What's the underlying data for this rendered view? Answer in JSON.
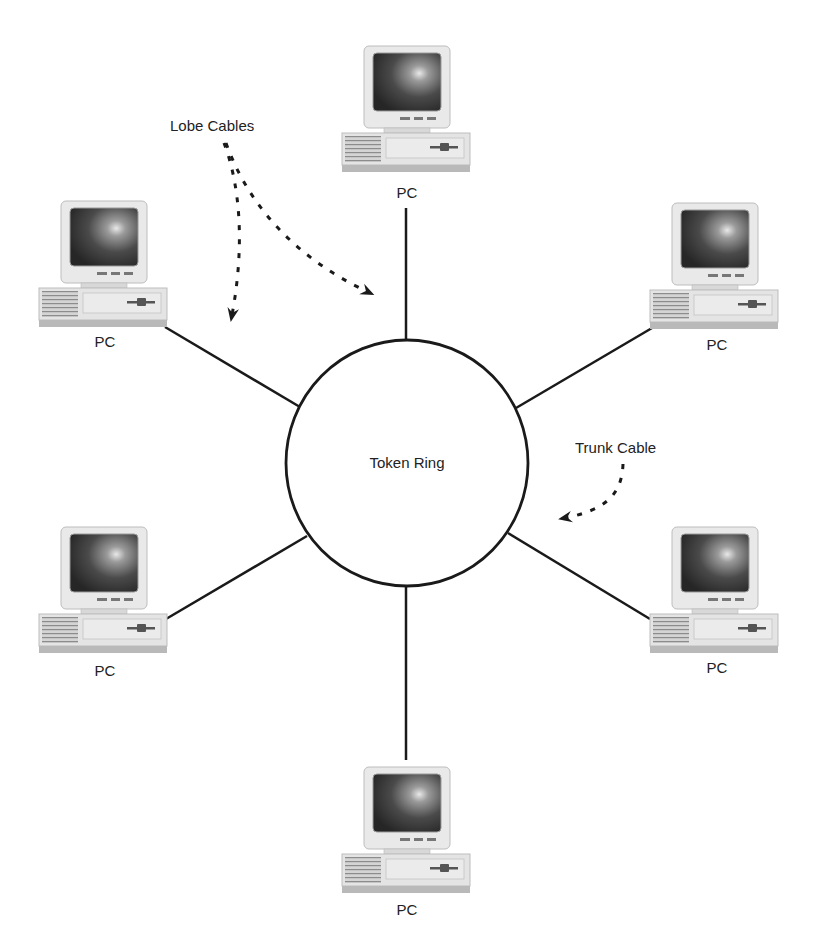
{
  "diagram": {
    "title": "Token Ring",
    "ring": {
      "label": "Token Ring",
      "cx": 407,
      "cy": 463,
      "r": 122
    },
    "annotations": {
      "lobe_cables": "Lobe Cables",
      "trunk_cable": "Trunk Cable"
    },
    "nodes": [
      {
        "id": "pc-top",
        "label": "PC",
        "position": "top"
      },
      {
        "id": "pc-top-left",
        "label": "PC",
        "position": "upper-left"
      },
      {
        "id": "pc-top-right",
        "label": "PC",
        "position": "upper-right"
      },
      {
        "id": "pc-bottom-left",
        "label": "PC",
        "position": "lower-left"
      },
      {
        "id": "pc-bottom-right",
        "label": "PC",
        "position": "lower-right"
      },
      {
        "id": "pc-bottom",
        "label": "PC",
        "position": "bottom"
      }
    ],
    "colors": {
      "line": "#1a1a1a",
      "monitor_case": "#e6e6e6",
      "screen_dark": "#2a2a2a",
      "screen_glow": "#d8d8d8",
      "background": "#ffffff"
    }
  }
}
